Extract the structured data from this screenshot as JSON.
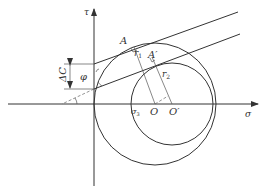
{
  "diagram": {
    "type": "mohr-coulomb-circles",
    "axes": {
      "x_label": "σ",
      "y_label": "τ"
    },
    "points": {
      "A": "A",
      "A_prime": "A′",
      "O": "O",
      "O_prime": "O′",
      "sigma3": "σ",
      "sigma3_sub": "3"
    },
    "radii": {
      "r1": "r",
      "r1_sub": "1",
      "r2": "r",
      "r2_sub": "2"
    },
    "annotations": {
      "delta_c": "ΔC",
      "phi": "φ"
    },
    "colors": {
      "line": "#333333",
      "background": "#ffffff"
    }
  }
}
